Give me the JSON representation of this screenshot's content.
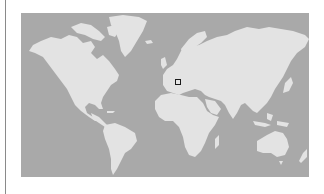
{
  "map": {
    "projection": "mercator",
    "ocean_color": "#a9a9a9",
    "land_color": "#e3e3e3",
    "marker": {
      "shape": "square",
      "region": "Italy / Adriatic",
      "border_color": "#1a1a1a",
      "x": 178,
      "y": 82
    }
  },
  "frame": {
    "left_rule_color": "#8a8a8a"
  }
}
